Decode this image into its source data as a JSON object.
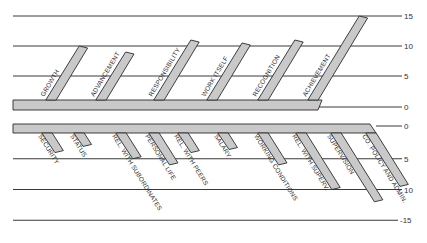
{
  "colors": {
    "bar_fill": "#c9c9c9",
    "bar_stroke": "#2b2b2b",
    "grid": "#3a3a3a",
    "background": "#ffffff"
  },
  "upper_axis": {
    "ticks": [
      "15",
      "10",
      "5",
      "0"
    ]
  },
  "lower_axis": {
    "ticks": [
      "0",
      "5",
      "10",
      "-15"
    ]
  },
  "chart_data": {
    "type": "bar",
    "title": "",
    "upper": {
      "axis": {
        "min": 0,
        "max": 15,
        "ticks": [
          0,
          5,
          10,
          15
        ]
      },
      "categories": [
        "GROWTH",
        "ADVANCEMENT",
        "RESPONSIBILITY",
        "WORK ITSELF",
        "RECOGNITION",
        "ACHIEVEMENT"
      ],
      "values": [
        10,
        9,
        11,
        10.5,
        11,
        15
      ]
    },
    "lower": {
      "axis": {
        "min": 0,
        "max": 15,
        "ticks": [
          0,
          5,
          10,
          15
        ],
        "tick_labels": [
          "0",
          "5",
          "10",
          "-15"
        ]
      },
      "categories": [
        "SECURITY",
        "STATUS",
        "REL. WITH SUBORDINATES",
        "PERSONAL LIFE",
        "REL. WITH PEERS",
        "SALARY",
        "WORKING CONDITIONS",
        "REL. WITH SUPERV.",
        "SUPERVISION",
        "CO. POLICY AND ADMIN."
      ],
      "values": [
        4,
        3,
        5,
        6,
        4,
        3.5,
        6,
        10,
        12,
        9.5
      ]
    }
  }
}
